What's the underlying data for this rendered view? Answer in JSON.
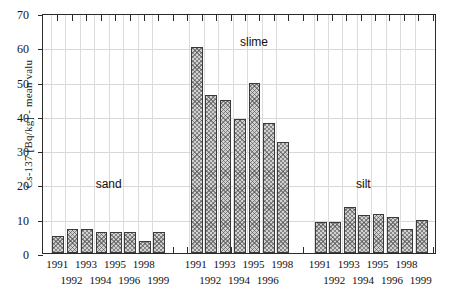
{
  "chart_data": {
    "type": "bar",
    "title": "",
    "xlabel": "",
    "ylabel": "Cs-137 [Bq/kg] - mean valu",
    "ylim": [
      0,
      70
    ],
    "ytick_labels": [
      "0",
      "10",
      "20",
      "30",
      "40",
      "50",
      "60",
      "70"
    ],
    "ytick_values": [
      0,
      10,
      20,
      30,
      40,
      50,
      60,
      70
    ],
    "grid": true,
    "legend": "none",
    "annotations": [
      {
        "text": "sand",
        "group": "sand"
      },
      {
        "text": "slime",
        "group": "slime"
      },
      {
        "text": "silt",
        "group": "silt"
      }
    ],
    "groups": [
      {
        "name": "sand",
        "label": "sand",
        "categories": [
          "1991",
          "1992",
          "1993",
          "1994",
          "1995",
          "1996",
          "1998",
          "1999"
        ],
        "values": [
          5,
          7,
          7,
          6,
          6,
          6,
          3.5,
          6
        ]
      },
      {
        "name": "slime",
        "label": "slime",
        "categories": [
          "1991",
          "1992",
          "1993",
          "1994",
          "1995",
          "1996",
          "1998"
        ],
        "values": [
          60,
          46,
          44.5,
          39,
          49.5,
          38,
          32.5
        ]
      },
      {
        "name": "silt",
        "label": "silt",
        "categories": [
          "1991",
          "1992",
          "1993",
          "1994",
          "1995",
          "1996",
          "1998",
          "1999"
        ],
        "values": [
          9,
          9,
          13.5,
          11,
          11.5,
          10.5,
          7,
          9.5
        ]
      }
    ]
  },
  "style": {
    "bar_fill": "#d2d2d2",
    "bar_edge": "#3a3a3a",
    "axis_color": "#2b2b2b",
    "grid_color": "#d8d8d8",
    "background": "#ffffff"
  }
}
